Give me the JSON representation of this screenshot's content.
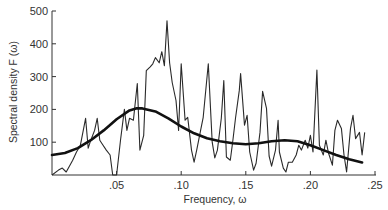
{
  "chart_data": {
    "type": "line",
    "title": "",
    "xlabel": "Frequency, ω",
    "ylabel": "Spectral density  F (ω)",
    "xlim": [
      0,
      0.25
    ],
    "ylim": [
      0,
      500
    ],
    "grid": false,
    "legend": null,
    "x_ticks": [
      ".05",
      ".10",
      ".15",
      ".20",
      ".25"
    ],
    "x_tick_values": [
      0.05,
      0.1,
      0.15,
      0.2,
      0.25
    ],
    "y_ticks": [
      "100",
      "200",
      "300",
      "400",
      "500"
    ],
    "y_tick_values": [
      100,
      200,
      300,
      400,
      500
    ],
    "series": [
      {
        "name": "Raw periodogram",
        "style": "thin jagged line",
        "x": [
          0.0,
          0.005,
          0.008,
          0.011,
          0.016,
          0.019,
          0.022,
          0.026,
          0.028,
          0.03,
          0.033,
          0.035,
          0.037,
          0.039,
          0.042,
          0.045,
          0.047,
          0.05,
          0.053,
          0.056,
          0.058,
          0.06,
          0.063,
          0.066,
          0.068,
          0.071,
          0.073,
          0.076,
          0.078,
          0.08,
          0.083,
          0.085,
          0.087,
          0.089,
          0.091,
          0.093,
          0.096,
          0.098,
          0.1,
          0.103,
          0.105,
          0.108,
          0.11,
          0.112,
          0.115,
          0.117,
          0.121,
          0.124,
          0.126,
          0.128,
          0.131,
          0.133,
          0.135,
          0.138,
          0.14,
          0.142,
          0.145,
          0.146,
          0.149,
          0.151,
          0.153,
          0.156,
          0.158,
          0.161,
          0.163,
          0.166,
          0.168,
          0.17,
          0.173,
          0.175,
          0.176,
          0.179,
          0.181,
          0.183,
          0.186,
          0.189,
          0.191,
          0.193,
          0.196,
          0.198,
          0.2,
          0.202,
          0.205,
          0.207,
          0.21,
          0.212,
          0.214,
          0.217,
          0.219,
          0.221,
          0.224,
          0.226,
          0.228,
          0.231,
          0.233,
          0.235,
          0.238,
          0.24,
          0.242
        ],
        "y": [
          0,
          15,
          21,
          9,
          45,
          70,
          91,
          173,
          82,
          106,
          136,
          173,
          106,
          94,
          76,
          61,
          0,
          0,
          106,
          200,
          136,
          173,
          167,
          279,
          76,
          121,
          318,
          330,
          339,
          358,
          342,
          376,
          333,
          470,
          342,
          282,
          227,
          136,
          339,
          167,
          176,
          76,
          39,
          76,
          136,
          176,
          339,
          100,
          52,
          76,
          173,
          288,
          55,
          45,
          106,
          173,
          258,
          309,
          152,
          182,
          70,
          15,
          36,
          130,
          255,
          203,
          58,
          27,
          76,
          167,
          70,
          21,
          9,
          39,
          39,
          61,
          91,
          76,
          106,
          82,
          121,
          70,
          320,
          91,
          61,
          106,
          67,
          30,
          136,
          167,
          142,
          61,
          9,
          142,
          182,
          111,
          130,
          61,
          130
        ],
        "color": "#2a2a2a"
      },
      {
        "name": "Smoothed spectral density",
        "style": "thick smooth line",
        "x": [
          0.0,
          0.01,
          0.02,
          0.03,
          0.04,
          0.05,
          0.06,
          0.065,
          0.07,
          0.08,
          0.09,
          0.1,
          0.11,
          0.12,
          0.13,
          0.14,
          0.15,
          0.16,
          0.17,
          0.18,
          0.19,
          0.2,
          0.21,
          0.22,
          0.23,
          0.24
        ],
        "y": [
          61,
          67,
          82,
          106,
          136,
          170,
          197,
          203,
          203,
          194,
          173,
          148,
          127,
          112,
          103,
          97,
          94,
          97,
          103,
          106,
          103,
          91,
          76,
          61,
          48,
          38
        ],
        "color": "#111111"
      }
    ]
  }
}
